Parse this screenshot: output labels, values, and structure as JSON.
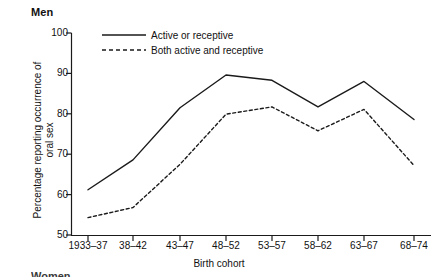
{
  "panel": {
    "title": "Men",
    "next_panel_title": "Women"
  },
  "axes": {
    "x_title": "Birth cohort",
    "y_title_line1": "Percentage reporting occurrence of",
    "y_title_line2": "oral sex"
  },
  "legend": {
    "items": [
      {
        "label": "Active or receptive",
        "style": "solid"
      },
      {
        "label": "Both active and receptive",
        "style": "dashed"
      }
    ]
  },
  "colors": {
    "line": "#1a1a1a",
    "axis": "#1a1a1a",
    "background": "#ffffff"
  },
  "chart_data": {
    "type": "line",
    "title": "Men",
    "xlabel": "Birth cohort",
    "ylabel": "Percentage reporting occurrence of oral sex",
    "categories": [
      "1933–37",
      "38–42",
      "43–47",
      "48–52",
      "53–57",
      "58–62",
      "63–67",
      "68–74"
    ],
    "ylim": [
      50,
      100
    ],
    "yticks": [
      50,
      60,
      70,
      80,
      90,
      100
    ],
    "grid": false,
    "legend_position": "top-left-inside",
    "series": [
      {
        "name": "Active or receptive",
        "style": "solid",
        "values": [
          61.2,
          68.6,
          81.5,
          89.6,
          88.3,
          81.7,
          88.0,
          78.6
        ]
      },
      {
        "name": "Both active and receptive",
        "style": "dashed",
        "values": [
          54.3,
          56.8,
          67.5,
          79.9,
          81.7,
          75.8,
          81.1,
          67.2
        ]
      }
    ]
  }
}
